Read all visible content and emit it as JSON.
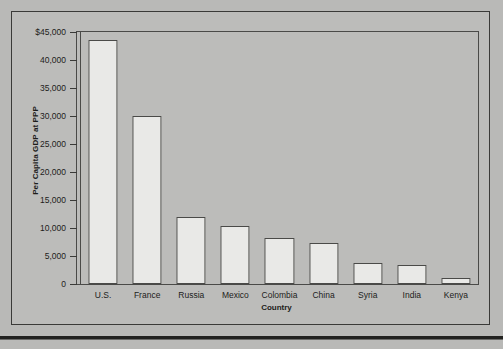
{
  "chart_data": {
    "type": "bar",
    "title": "",
    "subtitle": "",
    "xlabel": "Country",
    "ylabel": "Per Capita GDP at PPP",
    "categories": [
      "U.S.",
      "France",
      "Russia",
      "Mexico",
      "Colombia",
      "China",
      "Syria",
      "India",
      "Kenya"
    ],
    "values": [
      43500,
      30000,
      12000,
      10400,
      8200,
      7300,
      3700,
      3400,
      1000
    ],
    "ylim": [
      0,
      45000
    ],
    "ytick_values": [
      0,
      5000,
      10000,
      15000,
      20000,
      25000,
      30000,
      35000,
      40000,
      45000
    ],
    "ytick_labels": [
      "0",
      "5,000",
      "10,000",
      "15,000",
      "20,000",
      "25,000",
      "30,000",
      "35,000",
      "40,000",
      "$45,000"
    ],
    "grid": false,
    "legend": null,
    "legend_position": "none",
    "annotations": [],
    "series": [
      {
        "name": "Per Capita GDP at PPP",
        "values": [
          43500,
          30000,
          12000,
          10400,
          8200,
          7300,
          3700,
          3400,
          1000
        ]
      }
    ]
  },
  "style": {
    "page_background": "#b9b9b7",
    "panel_background": "#bcbcba",
    "bar_fill": "#e9e9e7",
    "bar_stroke": "#4a4a48",
    "axis_color": "#3a3a38",
    "text_color": "#1d1d1b"
  }
}
